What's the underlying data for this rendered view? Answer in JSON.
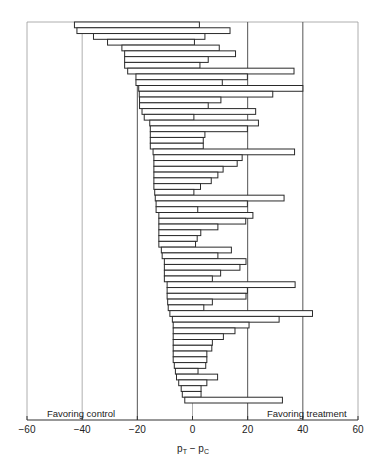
{
  "chart_data": {
    "type": "bar",
    "subtype": "horizontal-interval",
    "title": "",
    "xlabel": "pT - pC",
    "xlabel_main": "p",
    "xlabel_sub1": "T",
    "xlabel_sep": " − ",
    "xlabel_sub2": "C",
    "ylabel": "",
    "xlim": [
      -60,
      60
    ],
    "xticks": [
      -60,
      -40,
      -20,
      0,
      20,
      40,
      60
    ],
    "xtick_labels": [
      "−60",
      "−40",
      "−20",
      "0",
      "20",
      "40",
      "60"
    ],
    "grid": true,
    "grid_positions": [
      -60,
      -40,
      -20,
      0,
      20,
      40,
      60
    ],
    "annotations": [
      {
        "text": "Favoring control",
        "x": -50,
        "position": "bottom-left"
      },
      {
        "text": "Favoring treatment",
        "x": 30,
        "position": "bottom-right"
      }
    ],
    "series": [
      {
        "name": "Confidence intervals",
        "lower": [
          -42.8,
          -41.9,
          -35.9,
          -30.8,
          -25.6,
          -24.6,
          -24.6,
          -24.6,
          -23.5,
          -20.5,
          -20.5,
          -19.5,
          -19.3,
          -19.2,
          -19.2,
          -18.3,
          -17.5,
          -15.5,
          -15.3,
          -15.3,
          -15.3,
          -15.3,
          -14.3,
          -14.0,
          -14.0,
          -14.0,
          -14.0,
          -14.0,
          -14.0,
          -13.7,
          -13.5,
          -13.2,
          -13.2,
          -12.2,
          -12.2,
          -12.2,
          -12.2,
          -12.2,
          -12.2,
          -11.3,
          -11.0,
          -10.2,
          -10.2,
          -10.2,
          -10.2,
          -9.2,
          -9.2,
          -9.2,
          -9.0,
          -8.8,
          -8.2,
          -7.3,
          -7.0,
          -7.0,
          -7.0,
          -7.0,
          -7.0,
          -7.0,
          -7.0,
          -6.6,
          -6.2,
          -5.8,
          -5.0,
          -4.1,
          -3.7,
          -2.8
        ],
        "upper": [
          2.5,
          13.6,
          4.5,
          0.7,
          9.7,
          15.6,
          5.7,
          2.7,
          36.8,
          19.9,
          10.8,
          40.0,
          29.1,
          10.3,
          5.7,
          22.9,
          0.5,
          23.9,
          19.9,
          4.5,
          3.9,
          3.9,
          37.0,
          18.0,
          16.2,
          11.1,
          9.2,
          6.8,
          2.9,
          0.5,
          33.2,
          19.9,
          1.9,
          21.9,
          19.3,
          9.2,
          3.0,
          1.7,
          1.1,
          14.1,
          9.2,
          19.4,
          17.2,
          10.2,
          7.2,
          37.2,
          19.9,
          19.4,
          7.2,
          4.1,
          43.5,
          31.4,
          20.5,
          15.4,
          11.2,
          7.2,
          7.0,
          5.2,
          5.2,
          4.8,
          2.0,
          9.1,
          5.2,
          3.1,
          3.1,
          32.6
        ]
      }
    ],
    "n_intervals": 66
  },
  "axis": {
    "tick_labels": [
      "−60",
      "−40",
      "−20",
      "0",
      "20",
      "40",
      "60"
    ]
  },
  "labels": {
    "favoring_control": "Favoring control",
    "favoring_treatment": "Favoring treatment"
  },
  "colors": {
    "bar_stroke": "#2a2a2a",
    "bar_fill": "#ffffff",
    "grid": "#9a9a9a",
    "grid_strong": "#555555",
    "axis": "#333333"
  }
}
